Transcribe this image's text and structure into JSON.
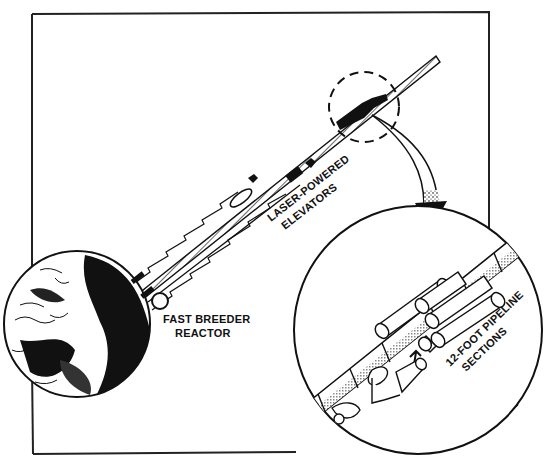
{
  "diagram": {
    "labels": {
      "elevators_line1": "LASER-POWERED",
      "elevators_line2": "ELEVATORS",
      "reactor_line1": "FAST BREEDER",
      "reactor_line2": "REACTOR",
      "pipeline_line1": "12-FOOT PIPELINE",
      "pipeline_line2": "SECTIONS"
    },
    "components": [
      {
        "id": "earth",
        "name": "Earth globe"
      },
      {
        "id": "tether",
        "name": "Space elevator pipeline"
      },
      {
        "id": "elevators",
        "name": "Laser-powered elevators"
      },
      {
        "id": "reactor",
        "name": "Fast breeder reactor"
      },
      {
        "id": "detail-circle",
        "name": "Dashed magnifier callout"
      },
      {
        "id": "inset",
        "name": "Inset of pipeline sections"
      }
    ],
    "colors": {
      "ink": "#111111",
      "paper": "#ffffff",
      "shade": "#9a9a9a"
    }
  }
}
